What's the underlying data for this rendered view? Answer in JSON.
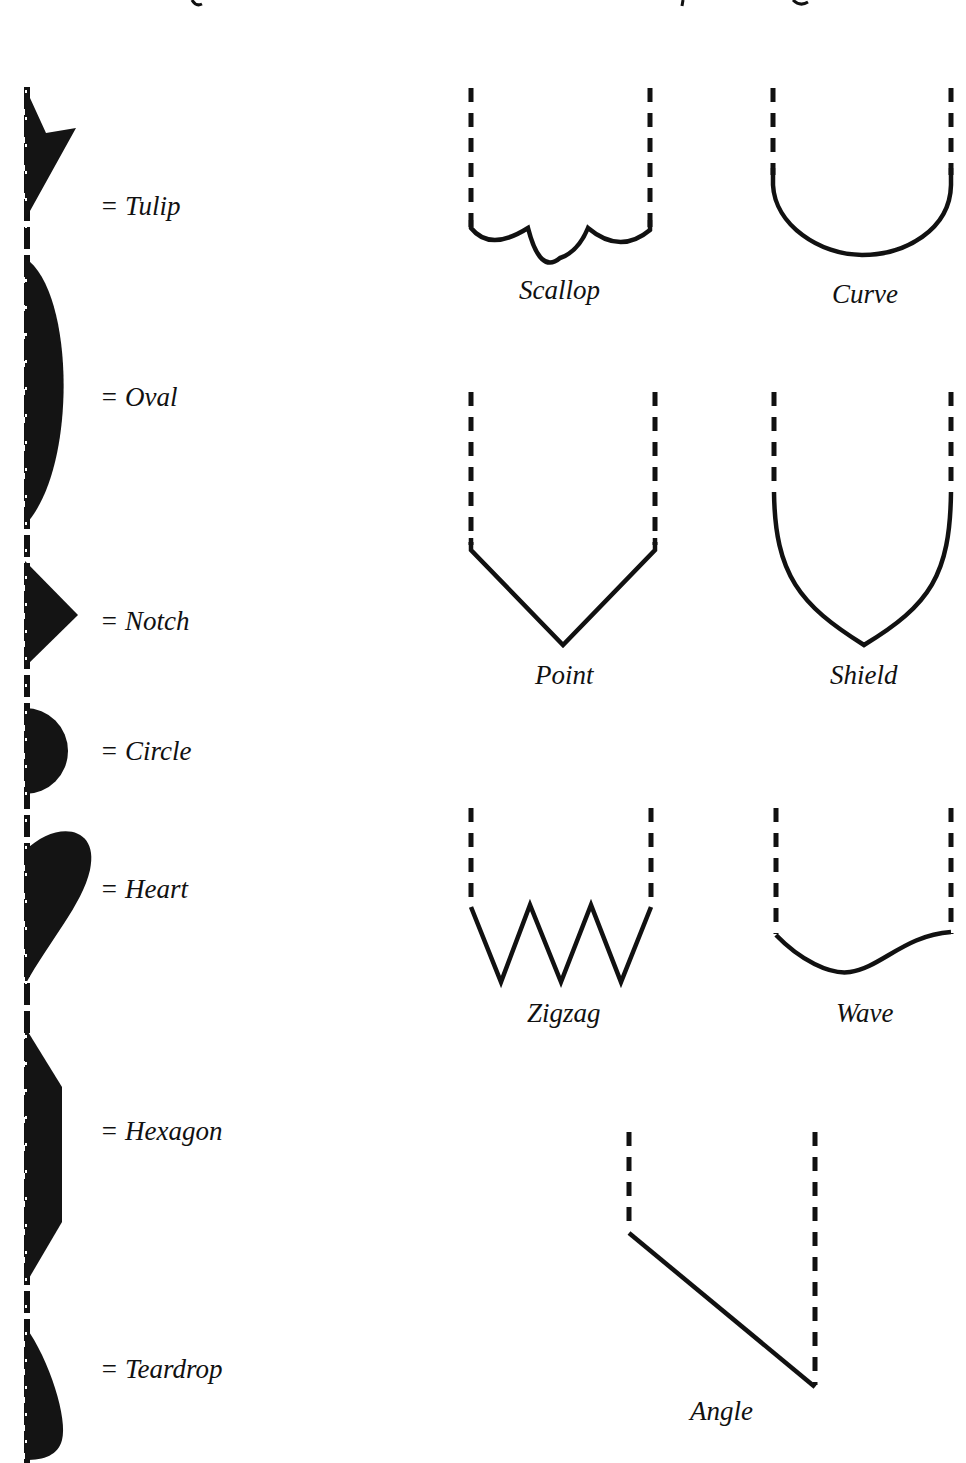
{
  "figure": {
    "type": "shape-reference-diagram",
    "header_cropped": true,
    "colors": {
      "ink": "#111111",
      "fill": "#141414",
      "background": "#ffffff"
    }
  },
  "left_panel": {
    "title": "Cutout shapes",
    "items": [
      {
        "id": "tulip",
        "label": "= Tulip"
      },
      {
        "id": "oval",
        "label": "= Oval"
      },
      {
        "id": "notch",
        "label": "= Notch"
      },
      {
        "id": "circle",
        "label": "= Circle"
      },
      {
        "id": "heart",
        "label": "= Heart"
      },
      {
        "id": "hexagon",
        "label": "= Hexagon"
      },
      {
        "id": "teardrop",
        "label": "= Teardrop"
      }
    ]
  },
  "right_panel": {
    "title": "Edge finishes",
    "items": [
      {
        "id": "scallop",
        "label": "Scallop"
      },
      {
        "id": "curve",
        "label": "Curve"
      },
      {
        "id": "point",
        "label": "Point"
      },
      {
        "id": "shield",
        "label": "Shield"
      },
      {
        "id": "zigzag",
        "label": "Zigzag"
      },
      {
        "id": "wave",
        "label": "Wave"
      },
      {
        "id": "angle",
        "label": "Angle"
      }
    ]
  }
}
